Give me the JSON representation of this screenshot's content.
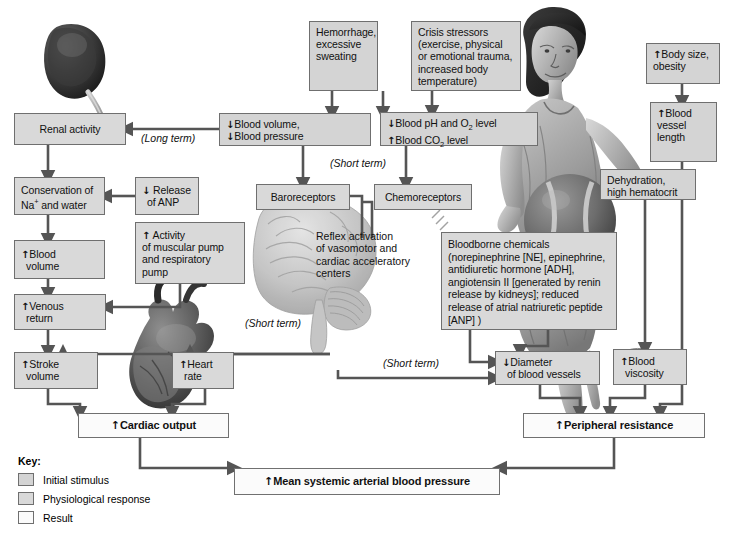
{
  "diagram": {
    "colors": {
      "stimulus_fill": "#d4d4d4",
      "response_fill": "#d9d9d9",
      "result_fill": "#fbfbfb",
      "box_border": "#6f6f6f",
      "connector": "#555555",
      "background": "#ffffff"
    }
  },
  "boxes": {
    "hemorrhage": "Hemorrhage, excessive sweating",
    "crisis": "Crisis stressors (exercise, physical or emotional trauma, increased body temperature)",
    "body_size": "Body size, obesity",
    "body_size_arrow": "↑",
    "blood_volume_pressure_l1": "Blood volume,",
    "blood_volume_pressure_l2": "Blood pressure",
    "blood_volume_pressure_a1": "↓",
    "blood_volume_pressure_a2": "↓",
    "blood_ph_l1_a": "↓",
    "blood_ph_l1_b": "Blood pH and O",
    "blood_ph_l1_sub": "2",
    "blood_ph_l1_c": " level",
    "blood_ph_l2_a": "↑",
    "blood_ph_l2_b": "Blood CO",
    "blood_ph_l2_sub": "2",
    "blood_ph_l2_c": " level",
    "vessel_length": "Blood vessel length",
    "vessel_length_arrow": "↑",
    "renal_activity": "Renal activity",
    "conservation_l1": "Conservation of",
    "conservation_l2_a": "Na",
    "conservation_l2_sup": "+",
    "conservation_l2_b": " and water",
    "release_anp_l1": "Release",
    "release_anp_l2": "of ANP",
    "release_anp_arrow": "↓",
    "blood_volume_l1": "Blood",
    "blood_volume_l2": "volume",
    "blood_volume_arrow": "↑",
    "activity_pump_l1": "Activity",
    "activity_pump_l2": "of muscular pump",
    "activity_pump_l3": "and respiratory",
    "activity_pump_l4": "pump",
    "activity_pump_arrow": "↑",
    "venous_return_l1": "Venous",
    "venous_return_l2": "return",
    "venous_return_arrow": "↑",
    "stroke_volume_l1": "Stroke",
    "stroke_volume_l2": "volume",
    "stroke_volume_arrow": "↑",
    "heart_rate_l1": "Heart",
    "heart_rate_l2": "rate",
    "heart_rate_arrow": "↑",
    "baroreceptors": "Baroreceptors",
    "chemoreceptors": "Chemoreceptors",
    "bloodborne": "Bloodborne chemicals (norepinephrine [NE], epinephrine, antidiuretic hormone [ADH], angiotensin II [generated by renin release by kidneys]; reduced release of atrial natriuretic peptide [ANP] )",
    "dehydration_l1": "Dehydration,",
    "dehydration_l2": "high hematocrit",
    "diameter_l1": "Diameter",
    "diameter_l2": "of blood vessels",
    "diameter_arrow": "↓",
    "viscosity_l1": "Blood",
    "viscosity_l2": "viscosity",
    "viscosity_arrow": "↑",
    "cardiac_output": "Cardiac output",
    "cardiac_output_arrow": "↑",
    "peripheral_resistance": "Peripheral resistance",
    "peripheral_resistance_arrow": "↑",
    "map": "Mean systemic arterial blood pressure",
    "map_arrow": "↑"
  },
  "labels": {
    "long_term": "(Long term)",
    "short_term_top": "(Short term)",
    "short_term_mid": "(Short term)",
    "short_term_low": "(Short term)",
    "reflex_l1": "Reflex activation",
    "reflex_l2": "of vasomotor and",
    "reflex_l3": "cardiac acceleratory",
    "reflex_l4": "centers"
  },
  "key": {
    "title": "Key:",
    "items": [
      {
        "label": "Initial stimulus",
        "swatch": "stimulus"
      },
      {
        "label": "Physiological response",
        "swatch": "response"
      },
      {
        "label": "Result",
        "swatch": "result"
      }
    ]
  },
  "art": {
    "kidney": "kidney-illustration",
    "brain": "brain-illustration",
    "heart": "heart-illustration",
    "athlete": "athlete-with-ball-illustration"
  }
}
